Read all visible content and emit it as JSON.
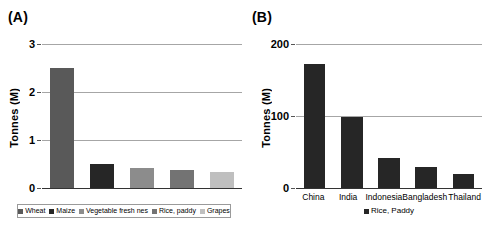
{
  "figure": {
    "panels": [
      {
        "label": "(A)",
        "ylabel": "Tonnes (M)",
        "yticks": [
          "0",
          "1",
          "2",
          "3"
        ],
        "legend": [
          {
            "name": "Wheat",
            "color": "#595959"
          },
          {
            "name": "Maize",
            "color": "#262626"
          },
          {
            "name": "Vegetable fresh nes",
            "color": "#8c8c8c"
          },
          {
            "name": "Rice, paddy",
            "color": "#737373"
          },
          {
            "name": "Grapes",
            "color": "#bfbfbf"
          }
        ]
      },
      {
        "label": "(B)",
        "ylabel": "Tonnes (M)",
        "yticks": [
          "0",
          "100",
          "200"
        ],
        "legend": [
          {
            "name": "Rice, Paddy",
            "color": "#262626"
          }
        ]
      }
    ]
  },
  "chart_data": [
    {
      "type": "bar",
      "title": "(A)",
      "categories": [
        "Wheat",
        "Maize",
        "Vegetable fresh nes",
        "Rice, paddy",
        "Grapes"
      ],
      "values": [
        2.5,
        0.5,
        0.42,
        0.38,
        0.33
      ],
      "colors": [
        "#595959",
        "#262626",
        "#8c8c8c",
        "#737373",
        "#bfbfbf"
      ],
      "xlabel": "",
      "ylabel": "Tonnes (M)",
      "ylim": [
        0,
        3
      ],
      "yticks": [
        0,
        1,
        2,
        3
      ],
      "grid": true,
      "legend_position": "bottom",
      "legend": [
        "Wheat",
        "Maize",
        "Vegetable fresh nes",
        "Rice, paddy",
        "Grapes"
      ]
    },
    {
      "type": "bar",
      "title": "(B)",
      "categories": [
        "China",
        "India",
        "Indonesia",
        "Bangladesh",
        "Thailand"
      ],
      "values": [
        172,
        98,
        41,
        29,
        20
      ],
      "colors": [
        "#262626",
        "#262626",
        "#262626",
        "#262626",
        "#262626"
      ],
      "xlabel": "",
      "ylabel": "Tonnes (M)",
      "ylim": [
        0,
        200
      ],
      "yticks": [
        0,
        100,
        200
      ],
      "grid": true,
      "legend_position": "bottom",
      "legend": [
        "Rice, Paddy"
      ]
    }
  ]
}
